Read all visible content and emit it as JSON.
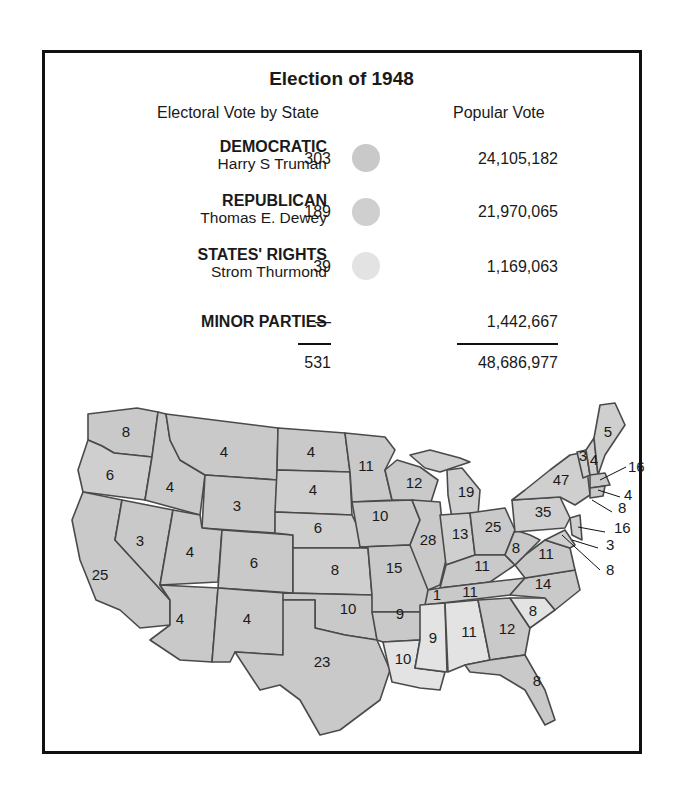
{
  "title": "Election of 1948",
  "headers": {
    "electoral": "Electoral Vote by State",
    "popular": "Popular Vote"
  },
  "parties": [
    {
      "name": "DEMOCRATIC",
      "candidate": "Harry S Truman",
      "electoral": "303",
      "popular": "24,105,182",
      "color": "#c9c9c9"
    },
    {
      "name": "REPUBLICAN",
      "candidate": "Thomas E. Dewey",
      "electoral": "189",
      "popular": "21,970,065",
      "color": "#d4d4d4"
    },
    {
      "name": "STATES' RIGHTS",
      "candidate": "Strom Thurmond",
      "electoral": "39",
      "popular": "1,169,063",
      "color": "#e6e6e6"
    },
    {
      "name": "MINOR PARTIES",
      "candidate": "",
      "electoral": "—",
      "popular": "1,442,667"
    }
  ],
  "totals": {
    "electoral": "531",
    "popular": "48,686,977"
  },
  "map": {
    "colors": {
      "democratic": "#c8c8c8",
      "republican": "#cfcfcf",
      "states_rights": "#e4e4e4",
      "border": "#4a4a4a"
    },
    "labels": [
      {
        "state": "WA",
        "v": "8",
        "x": 126,
        "y": 437
      },
      {
        "state": "OR",
        "v": "6",
        "x": 110,
        "y": 480
      },
      {
        "state": "CA",
        "v": "25",
        "x": 100,
        "y": 580
      },
      {
        "state": "ID",
        "v": "4",
        "x": 170,
        "y": 492
      },
      {
        "state": "NV",
        "v": "3",
        "x": 140,
        "y": 546
      },
      {
        "state": "MT",
        "v": "4",
        "x": 224,
        "y": 457
      },
      {
        "state": "WY",
        "v": "3",
        "x": 237,
        "y": 511
      },
      {
        "state": "UT",
        "v": "4",
        "x": 190,
        "y": 557
      },
      {
        "state": "CO",
        "v": "6",
        "x": 254,
        "y": 568
      },
      {
        "state": "AZ",
        "v": "4",
        "x": 180,
        "y": 624
      },
      {
        "state": "NM",
        "v": "4",
        "x": 247,
        "y": 624
      },
      {
        "state": "ND",
        "v": "4",
        "x": 311,
        "y": 457
      },
      {
        "state": "SD",
        "v": "4",
        "x": 313,
        "y": 495
      },
      {
        "state": "NE",
        "v": "6",
        "x": 318,
        "y": 533
      },
      {
        "state": "KS",
        "v": "8",
        "x": 335,
        "y": 575
      },
      {
        "state": "OK",
        "v": "10",
        "x": 348,
        "y": 614
      },
      {
        "state": "TX",
        "v": "23",
        "x": 322,
        "y": 667
      },
      {
        "state": "MN",
        "v": "11",
        "x": 366,
        "y": 471
      },
      {
        "state": "IA",
        "v": "10",
        "x": 380,
        "y": 521
      },
      {
        "state": "MO",
        "v": "15",
        "x": 394,
        "y": 573
      },
      {
        "state": "AR",
        "v": "9",
        "x": 400,
        "y": 619
      },
      {
        "state": "LA",
        "v": "10",
        "x": 403,
        "y": 664
      },
      {
        "state": "WI",
        "v": "12",
        "x": 414,
        "y": 488
      },
      {
        "state": "IL",
        "v": "28",
        "x": 428,
        "y": 545
      },
      {
        "state": "MS",
        "v": "9",
        "x": 433,
        "y": 643
      },
      {
        "state": "MI",
        "v": "19",
        "x": 466,
        "y": 497
      },
      {
        "state": "IN",
        "v": "13",
        "x": 460,
        "y": 539
      },
      {
        "state": "KY",
        "v": "11",
        "x": 482,
        "y": 571
      },
      {
        "state": "TN",
        "v": "11",
        "x": 470,
        "y": 597
      },
      {
        "state": "TN-W",
        "v": "1",
        "x": 437,
        "y": 600
      },
      {
        "state": "AL",
        "v": "11",
        "x": 469,
        "y": 637
      },
      {
        "state": "GA",
        "v": "12",
        "x": 507,
        "y": 634
      },
      {
        "state": "FL",
        "v": "8",
        "x": 537,
        "y": 686
      },
      {
        "state": "OH",
        "v": "25",
        "x": 493,
        "y": 532
      },
      {
        "state": "WV",
        "v": "8",
        "x": 516,
        "y": 553
      },
      {
        "state": "VA",
        "v": "11",
        "x": 546,
        "y": 559
      },
      {
        "state": "NC",
        "v": "14",
        "x": 543,
        "y": 589
      },
      {
        "state": "SC",
        "v": "8",
        "x": 533,
        "y": 616
      },
      {
        "state": "PA",
        "v": "35",
        "x": 543,
        "y": 517
      },
      {
        "state": "NY",
        "v": "47",
        "x": 561,
        "y": 485
      },
      {
        "state": "VT",
        "v": "3",
        "x": 583,
        "y": 461
      },
      {
        "state": "NH",
        "v": "4",
        "x": 594,
        "y": 465
      },
      {
        "state": "ME",
        "v": "5",
        "x": 608,
        "y": 437
      }
    ],
    "callouts": [
      {
        "state": "MA",
        "v": "16",
        "lx": 628,
        "ly": 472
      },
      {
        "state": "RI",
        "v": "4",
        "lx": 624,
        "ly": 500
      },
      {
        "state": "CT",
        "v": "8",
        "lx": 618,
        "ly": 513
      },
      {
        "state": "NJ",
        "v": "16",
        "lx": 614,
        "ly": 533
      },
      {
        "state": "DE",
        "v": "3",
        "lx": 606,
        "ly": 550
      },
      {
        "state": "MD",
        "v": "8",
        "lx": 606,
        "ly": 575
      }
    ]
  }
}
